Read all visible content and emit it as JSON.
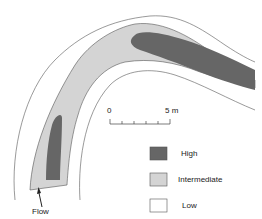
{
  "diagram": {
    "type": "river-channel-zonation-map",
    "colors": {
      "high": "#666666",
      "intermediate": "#d4d4d4",
      "low": "#ffffff",
      "outline": "#555555"
    },
    "scale_bar": {
      "start_label": "0",
      "end_label": "5 m",
      "ticks": 6
    },
    "flow_label": "Flow",
    "legend": [
      {
        "label": "High",
        "color": "#666666"
      },
      {
        "label": "Intermediate",
        "color": "#d4d4d4"
      },
      {
        "label": "Low",
        "color": "#ffffff"
      }
    ]
  }
}
